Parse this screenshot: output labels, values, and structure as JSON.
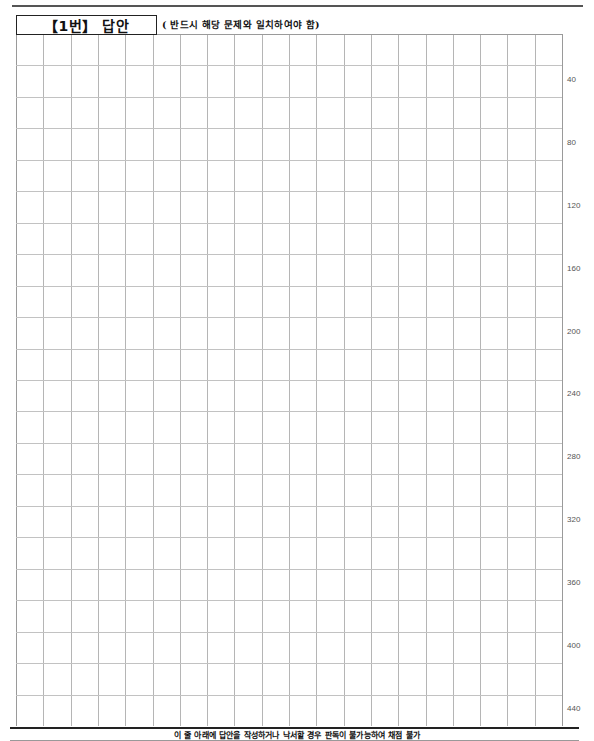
{
  "header": {
    "title": "【1번】 답안",
    "instruction": "( 반드시 해당 문제와 일치하여야 함)"
  },
  "grid": {
    "columns": 20,
    "rows": 22,
    "cell_width": 27.3,
    "cell_height": 31.45,
    "counter_labels": [
      "40",
      "80",
      "120",
      "160",
      "200",
      "240",
      "280",
      "320",
      "360",
      "400",
      "440"
    ]
  },
  "footer": {
    "warning": "이 줄 아래에 답안을 작성하거나 낙서할 경우 판독이 불가능하여 채점 불가"
  },
  "colors": {
    "grid_line": "#b5b5b5",
    "rule": "#222222",
    "label": "#555555"
  }
}
